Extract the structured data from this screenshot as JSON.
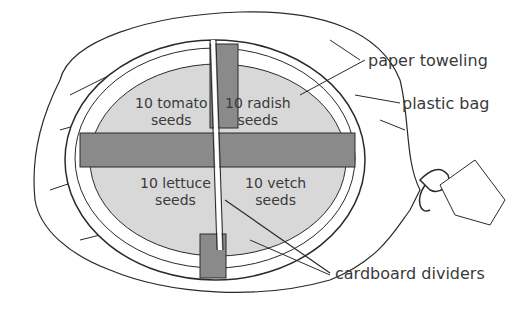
{
  "diagram": {
    "type": "seed germination setup",
    "sections": [
      {
        "id": "tomato",
        "count": "10 tomato",
        "unit": "seeds"
      },
      {
        "id": "radish",
        "count": "10 radish",
        "unit": "seeds"
      },
      {
        "id": "lettuce",
        "count": "10 lettuce",
        "unit": "seeds"
      },
      {
        "id": "vetch",
        "count": "10 vetch",
        "unit": "seeds"
      }
    ],
    "callouts": {
      "paper_toweling": "paper toweling",
      "plastic_bag": "plastic bag",
      "cardboard_dividers": "cardboard dividers"
    },
    "colors": {
      "paper": "#d8d8d8",
      "divider": "#8a8a8a",
      "line": "#2a2a2a",
      "bag": "#ffffff"
    }
  }
}
